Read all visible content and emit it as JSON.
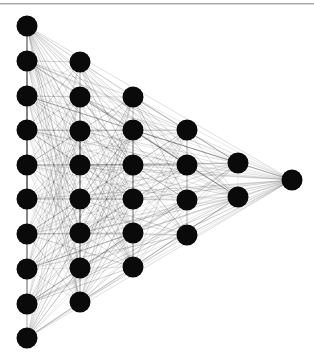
{
  "figure": {
    "type": "node-link-diagram",
    "layout": "triangular-staircase",
    "background_color": "#ffffff",
    "top_border_color": "#a9a9ac"
  },
  "chart_data": {
    "type": "scatter",
    "title": "",
    "xlabel": "",
    "ylabel": "",
    "grid": false,
    "legend": null,
    "node_count": 31,
    "edge_count": 420,
    "node_color": "#0a0a0a",
    "node_radius": 10.5,
    "edge_color": "#3a3a3a",
    "edge_opacity": 0.22,
    "edge_width": 0.55,
    "xlim": [
      0,
      314
    ],
    "ylim": [
      0,
      359
    ],
    "columns": [
      {
        "index": 0,
        "x": 27,
        "count": 10,
        "y_start": 26,
        "y_step": 34.7
      },
      {
        "index": 1,
        "x": 80,
        "count": 8,
        "y_start": 62,
        "y_step": 34.3
      },
      {
        "index": 2,
        "x": 133,
        "count": 6,
        "y_start": 97,
        "y_step": 34.0
      },
      {
        "index": 3,
        "x": 187,
        "count": 4,
        "y_start": 130,
        "y_step": 35.0
      },
      {
        "index": 4,
        "x": 238,
        "count": 2,
        "y_start": 163,
        "y_step": 34.0
      },
      {
        "index": 5,
        "x": 292,
        "count": 1,
        "y_start": 180,
        "y_step": 0
      }
    ],
    "nodes": [
      {
        "id": 0,
        "col": 0,
        "row": 0,
        "x": 27,
        "y": 26
      },
      {
        "id": 1,
        "col": 0,
        "row": 1,
        "x": 27,
        "y": 61
      },
      {
        "id": 2,
        "col": 0,
        "row": 2,
        "x": 27,
        "y": 96
      },
      {
        "id": 3,
        "col": 0,
        "row": 3,
        "x": 27,
        "y": 130
      },
      {
        "id": 4,
        "col": 0,
        "row": 4,
        "x": 27,
        "y": 165
      },
      {
        "id": 5,
        "col": 0,
        "row": 5,
        "x": 27,
        "y": 199
      },
      {
        "id": 6,
        "col": 0,
        "row": 6,
        "x": 27,
        "y": 234
      },
      {
        "id": 7,
        "col": 0,
        "row": 7,
        "x": 27,
        "y": 269
      },
      {
        "id": 8,
        "col": 0,
        "row": 8,
        "x": 27,
        "y": 304
      },
      {
        "id": 9,
        "col": 0,
        "row": 9,
        "x": 27,
        "y": 338
      },
      {
        "id": 10,
        "col": 1,
        "row": 0,
        "x": 80,
        "y": 62
      },
      {
        "id": 11,
        "col": 1,
        "row": 1,
        "x": 80,
        "y": 97
      },
      {
        "id": 12,
        "col": 1,
        "row": 2,
        "x": 80,
        "y": 131
      },
      {
        "id": 13,
        "col": 1,
        "row": 3,
        "x": 80,
        "y": 165
      },
      {
        "id": 14,
        "col": 1,
        "row": 4,
        "x": 80,
        "y": 199
      },
      {
        "id": 15,
        "col": 1,
        "row": 5,
        "x": 80,
        "y": 233
      },
      {
        "id": 16,
        "col": 1,
        "row": 6,
        "x": 80,
        "y": 268
      },
      {
        "id": 17,
        "col": 1,
        "row": 7,
        "x": 80,
        "y": 302
      },
      {
        "id": 18,
        "col": 2,
        "row": 0,
        "x": 133,
        "y": 97
      },
      {
        "id": 19,
        "col": 2,
        "row": 1,
        "x": 133,
        "y": 130
      },
      {
        "id": 20,
        "col": 2,
        "row": 2,
        "x": 133,
        "y": 165
      },
      {
        "id": 21,
        "col": 2,
        "row": 3,
        "x": 133,
        "y": 199
      },
      {
        "id": 22,
        "col": 2,
        "row": 4,
        "x": 133,
        "y": 233
      },
      {
        "id": 23,
        "col": 2,
        "row": 5,
        "x": 133,
        "y": 267
      },
      {
        "id": 24,
        "col": 3,
        "row": 0,
        "x": 187,
        "y": 130
      },
      {
        "id": 25,
        "col": 3,
        "row": 1,
        "x": 187,
        "y": 165
      },
      {
        "id": 26,
        "col": 3,
        "row": 2,
        "x": 187,
        "y": 200
      },
      {
        "id": 27,
        "col": 3,
        "row": 3,
        "x": 187,
        "y": 235
      },
      {
        "id": 28,
        "col": 4,
        "row": 0,
        "x": 238,
        "y": 163
      },
      {
        "id": 29,
        "col": 4,
        "row": 1,
        "x": 238,
        "y": 197
      },
      {
        "id": 30,
        "col": 5,
        "row": 0,
        "x": 292,
        "y": 180
      }
    ]
  }
}
